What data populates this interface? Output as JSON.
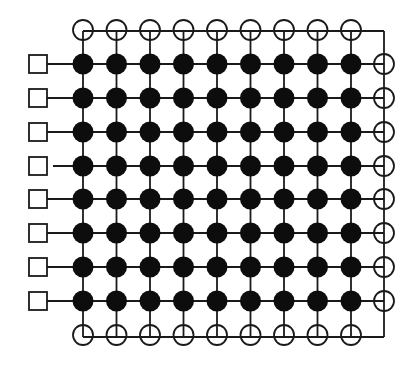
{
  "diagram": {
    "title": "",
    "type": "grid-network",
    "colors": {
      "background": "#ffffff",
      "stroke": "#1a1a1a",
      "filled_node": "#0d0d0d",
      "open_node_fill": "#ffffff"
    },
    "grid": {
      "rows": 8,
      "cols": 9,
      "col_x": [
        83,
        116.5,
        150,
        183.5,
        217,
        250.5,
        284,
        317.5,
        351
      ],
      "row_y": [
        64,
        98,
        132,
        166,
        199,
        233,
        267,
        301
      ],
      "filled_node_radius": 10.5
    },
    "top_open_nodes": {
      "y": 30,
      "radius": 10,
      "count": 9
    },
    "bottom_open_nodes": {
      "y": 335,
      "radius": 10,
      "count": 9
    },
    "right_open_nodes": {
      "x": 384,
      "radius": 10,
      "count": 8
    },
    "top_bus": {
      "y": 31,
      "x_start": 83,
      "x_end": 384
    },
    "bottom_bus": {
      "y": 337,
      "x_start": 83,
      "x_end": 384
    },
    "right_bus": {
      "x": 384,
      "y_start": 31,
      "y_end": 337
    },
    "left_squares": {
      "count": 8,
      "x": 29,
      "size": 18,
      "rows_with_gap": [
        3
      ],
      "gap_px": 6
    },
    "node_types": [
      {
        "name": "filled-node",
        "label": "filled circle"
      },
      {
        "name": "open-node",
        "label": "open circle (crossed)"
      },
      {
        "name": "square-node",
        "label": "open square"
      }
    ]
  }
}
